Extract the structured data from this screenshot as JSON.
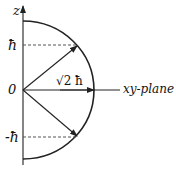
{
  "diagram": {
    "axis_label": "z",
    "origin_label": "0",
    "upper_level_label": "ħ",
    "lower_level_label": "-ħ",
    "vector_length_label": "√2 ħ",
    "plane_label": "xy-plane",
    "colors": {
      "line": "#222222",
      "dashed": "#555555",
      "background": "#ffffff"
    }
  }
}
